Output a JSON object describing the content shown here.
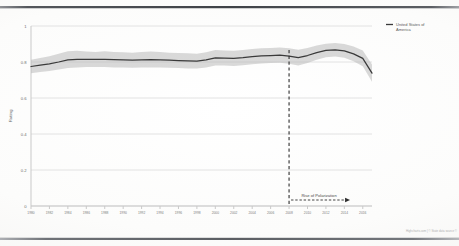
{
  "chart_data": {
    "type": "line",
    "title": "",
    "subtitle": "",
    "xlabel": "",
    "ylabel": "Rating",
    "xlim": [
      1980,
      2017
    ],
    "ylim": [
      0,
      1
    ],
    "grid": true,
    "legend_position": "top-right",
    "y_ticks": [
      "0",
      "0.2",
      "0.4",
      "0.6",
      "0.8",
      "1"
    ],
    "y_tick_values": [
      0,
      0.2,
      0.4,
      0.6,
      0.8,
      1
    ],
    "x_ticks": [
      "1980",
      "1982",
      "1984",
      "1986",
      "1988",
      "1990",
      "1992",
      "1994",
      "1996",
      "1998",
      "2000",
      "2002",
      "2004",
      "2006",
      "2008",
      "2010",
      "2012",
      "2014",
      "2016"
    ],
    "x_tick_values": [
      1980,
      1982,
      1984,
      1986,
      1988,
      1990,
      1992,
      1994,
      1996,
      1998,
      2000,
      2002,
      2004,
      2006,
      2008,
      2010,
      2012,
      2014,
      2016
    ],
    "series": [
      {
        "name": "United States of America",
        "color": "#3a3a3a",
        "x": [
          1980,
          1981,
          1982,
          1983,
          1984,
          1985,
          1986,
          1987,
          1988,
          1989,
          1990,
          1991,
          1992,
          1993,
          1994,
          1995,
          1996,
          1997,
          1998,
          1999,
          2000,
          2001,
          2002,
          2003,
          2004,
          2005,
          2006,
          2007,
          2008,
          2009,
          2010,
          2011,
          2012,
          2013,
          2014,
          2015,
          2016,
          2017
        ],
        "values": [
          0.775,
          0.782,
          0.79,
          0.8,
          0.812,
          0.815,
          0.815,
          0.814,
          0.815,
          0.813,
          0.812,
          0.81,
          0.812,
          0.813,
          0.812,
          0.81,
          0.808,
          0.806,
          0.805,
          0.812,
          0.823,
          0.822,
          0.82,
          0.824,
          0.83,
          0.834,
          0.836,
          0.838,
          0.833,
          0.824,
          0.836,
          0.852,
          0.864,
          0.868,
          0.862,
          0.845,
          0.82,
          0.738
        ]
      }
    ],
    "band": {
      "name": "confidence interval",
      "color": "#b9b9b9",
      "upper": [
        0.812,
        0.822,
        0.832,
        0.846,
        0.86,
        0.862,
        0.858,
        0.856,
        0.86,
        0.856,
        0.854,
        0.852,
        0.856,
        0.858,
        0.856,
        0.852,
        0.85,
        0.848,
        0.846,
        0.854,
        0.866,
        0.864,
        0.862,
        0.866,
        0.872,
        0.876,
        0.878,
        0.88,
        0.876,
        0.868,
        0.878,
        0.892,
        0.902,
        0.906,
        0.9,
        0.886,
        0.864,
        0.786
      ],
      "lower": [
        0.738,
        0.744,
        0.75,
        0.758,
        0.766,
        0.77,
        0.772,
        0.772,
        0.772,
        0.77,
        0.77,
        0.768,
        0.77,
        0.77,
        0.77,
        0.768,
        0.766,
        0.764,
        0.764,
        0.77,
        0.78,
        0.78,
        0.778,
        0.782,
        0.788,
        0.792,
        0.794,
        0.796,
        0.79,
        0.78,
        0.794,
        0.812,
        0.826,
        0.83,
        0.824,
        0.804,
        0.776,
        0.69
      ]
    },
    "annotations": [
      {
        "name": "polarization-marker",
        "type": "vertical-dashed-line",
        "x": 2008,
        "label": "Rise of Polarization",
        "label_has_arrow": true
      }
    ]
  },
  "legend": {
    "entries": [
      {
        "label_line1": "United States of",
        "label_line2": "America",
        "color": "#3a3a3a"
      }
    ]
  },
  "axis": {
    "y_title": "Rating"
  },
  "credit": {
    "text": "Highcharts.com | © State data source ©"
  }
}
